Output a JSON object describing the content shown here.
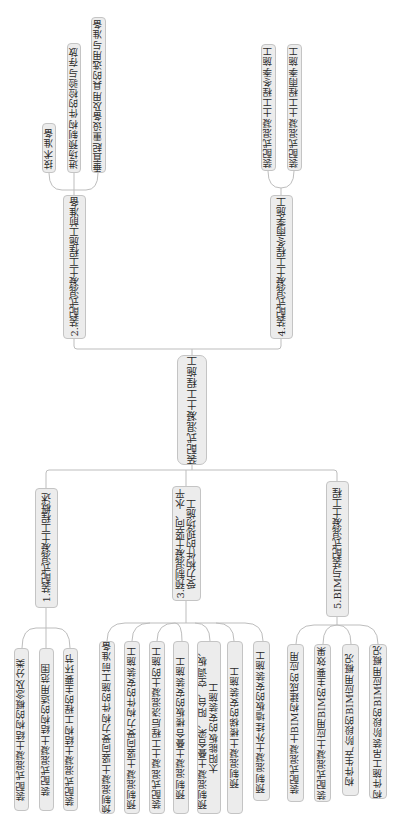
{
  "root": {
    "label": "装配式混凝土工程施工"
  },
  "branches": [
    {
      "label": "1.装配式混凝土工程概述",
      "children": [
        "装配式混凝土结构的概念及分类",
        "装配式混凝土结构的适用范围",
        "装配式混凝土结构工程的主要环节"
      ]
    },
    {
      "label": "2.装配式混凝土工程施工前准备",
      "children": [
        "技术准备",
        "进场预制构件的检验与存放",
        "垂直起重设备及用具的选用与准备"
      ]
    },
    {
      "label": "3.预制混凝土竖向、水平\n受力构件的现场施工",
      "children": [
        "预制混凝土竖向受力构件的施工前准备",
        "预制混凝土竖向受力构件的安装施工",
        "装配式混凝土工程后浇混凝土的施工",
        "预制混凝土叠合楼板的安装施工",
        "预制混凝土叠合梁、阳台、空调板、\n太阳能板的安装施工",
        "预制混凝土楼梯的安装施工",
        "预制混凝土外挂墙板的安装施工"
      ]
    },
    {
      "label": "4.装配式混凝土工程冬雨季施工",
      "children": [
        "装配式混凝土工程冬季施工",
        "装配式混凝土工程雨季施工"
      ]
    },
    {
      "label": "5.BIM与装配式混凝土工程",
      "children": [
        "装配式混凝土BIM构建成的应用",
        "装配式混凝土应用BIM的主要效果",
        "构件生产阶段的BIM应用概况",
        "构件施工吊装阶段的BIM应用概况"
      ]
    }
  ],
  "colors": {
    "node_fill": "#ececec",
    "node_border": "#c4c4c4",
    "connector": "#bdbdbd",
    "text": "#2a2a2a",
    "background": "#ffffff"
  }
}
